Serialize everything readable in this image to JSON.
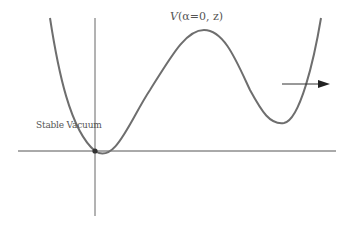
{
  "diagram": {
    "title_italic_V": "V",
    "title_rest": "(α=0, z)",
    "stable_vacuum_label": "Stable Vacuum",
    "colors": {
      "curve": "#6e6e6e",
      "axes": "#555555",
      "arrow": "#222222",
      "dot": "#333333",
      "text": "#555555"
    }
  }
}
